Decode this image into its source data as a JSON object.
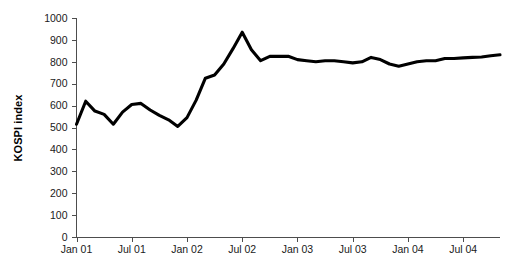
{
  "chart_data": {
    "type": "line",
    "title": "",
    "xlabel": "",
    "ylabel": "KOSPI index",
    "ylim": [
      0,
      1000
    ],
    "ytick_values": [
      0,
      100,
      200,
      300,
      400,
      500,
      600,
      700,
      800,
      900,
      1000
    ],
    "ytick_labels": [
      "0",
      "100",
      "200",
      "300",
      "400",
      "500",
      "600",
      "700",
      "800",
      "900",
      "1000"
    ],
    "xtick_labels": [
      "Jan 01",
      "Jul 01",
      "Jan 02",
      "Jul 02",
      "Jan 03",
      "Jul 03",
      "Jan 04",
      "Jul 04"
    ],
    "xtick_months": [
      0,
      6,
      12,
      18,
      24,
      30,
      36,
      42
    ],
    "xlim_months": [
      0,
      46
    ],
    "grid": false,
    "legend": false,
    "line_color": "#000000",
    "series": [
      {
        "name": "KOSPI index",
        "x_labels": [
          "Jan 01",
          "Feb 01",
          "Mar 01",
          "Apr 01",
          "May 01",
          "Jun 01",
          "Jul 01",
          "Aug 01",
          "Sep 01",
          "Oct 01",
          "Nov 01",
          "Dec 01",
          "Jan 02",
          "Feb 02",
          "Mar 02",
          "Apr 02",
          "May 02",
          "Jun 02",
          "Jul 02",
          "Aug 02",
          "Sep 02",
          "Oct 02",
          "Nov 02",
          "Dec 02",
          "Jan 03",
          "Feb 03",
          "Mar 03",
          "Apr 03",
          "May 03",
          "Jun 03",
          "Jul 03",
          "Aug 03",
          "Sep 03",
          "Oct 03",
          "Nov 03",
          "Dec 03",
          "Jan 04",
          "Feb 04",
          "Mar 04",
          "Apr 04",
          "May 04",
          "Jun 04",
          "Jul 04",
          "Aug 04",
          "Sep 04",
          "Oct 04",
          "Nov 04"
        ],
        "x_months": [
          0,
          1,
          2,
          3,
          4,
          5,
          6,
          7,
          8,
          9,
          10,
          11,
          12,
          13,
          14,
          15,
          16,
          17,
          18,
          19,
          20,
          21,
          22,
          23,
          24,
          25,
          26,
          27,
          28,
          29,
          30,
          31,
          32,
          33,
          34,
          35,
          36,
          37,
          38,
          39,
          40,
          41,
          42,
          43,
          44,
          45,
          46
        ],
        "values": [
          515,
          620,
          575,
          560,
          515,
          570,
          605,
          610,
          580,
          555,
          535,
          505,
          545,
          625,
          725,
          740,
          790,
          860,
          935,
          855,
          805,
          825,
          825,
          825,
          810,
          805,
          800,
          805,
          805,
          800,
          795,
          800,
          820,
          810,
          790,
          780,
          790,
          800,
          805,
          805,
          815,
          815,
          818,
          820,
          822,
          828,
          832
        ]
      }
    ],
    "annotations": []
  }
}
